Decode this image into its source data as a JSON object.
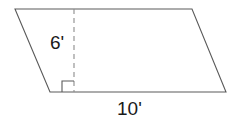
{
  "figure": {
    "kind": "parallelogram-with-height",
    "stroke_color": "#5a5a5a",
    "dash_color": "#8c8c8c",
    "text_color": "#1a1a1a",
    "background_color": "#ffffff",
    "shape": {
      "name": "parallelogram-outline",
      "vertices": [
        {
          "name": "top-left",
          "x": 15,
          "y": 9
        },
        {
          "name": "top-right",
          "x": 192,
          "y": 9
        },
        {
          "name": "bottom-right",
          "x": 226,
          "y": 92
        },
        {
          "name": "bottom-left",
          "x": 50,
          "y": 92
        }
      ],
      "points_attr": "15,9 192,9 226,92 50,92"
    },
    "height_segment": {
      "name": "height-dashed-line",
      "x1": 74,
      "y1": 9,
      "x2": 74,
      "y2": 92,
      "dash_pattern": "5,4"
    },
    "right_angle_marker": {
      "name": "right-angle-square",
      "points_attr": "74,81 62,81 62,92"
    },
    "labels": {
      "height": "6'",
      "base": "10'"
    }
  }
}
